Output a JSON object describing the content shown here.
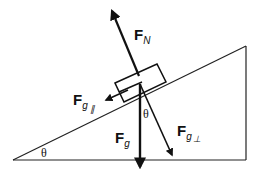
{
  "diagram": {
    "type": "free-body diagram, block on inclined plane",
    "labels": {
      "normal_force": {
        "main": "F",
        "sub": "N"
      },
      "gravity": {
        "main": "F",
        "sub": "g"
      },
      "gravity_parallel": {
        "main": "F",
        "sub": "g",
        "subsub": "∥"
      },
      "gravity_perpendicular": {
        "main": "F",
        "sub": "g",
        "subsub": "⊥"
      },
      "incline_angle": "θ",
      "force_angle": "θ"
    },
    "colors": {
      "line": "#111111",
      "background": "#ffffff"
    }
  }
}
